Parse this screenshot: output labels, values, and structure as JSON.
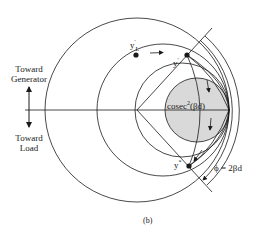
{
  "figure": {
    "caption": "(b)",
    "left_labels": {
      "top": [
        "Toward",
        "Generator"
      ],
      "bottom": [
        "Toward",
        "Load"
      ]
    },
    "points": {
      "yL": {
        "base": "y",
        "sup": "'",
        "sub": "L"
      },
      "y_prime": {
        "base": "y",
        "sup": "'"
      },
      "y_star": {
        "base": "y",
        "sup": "*"
      }
    },
    "shaded_label": {
      "base": "cosec",
      "sup": "2",
      "rest": "(βd)"
    },
    "angle_label": "ϕ = 2βd",
    "colors": {
      "stroke": "#1a1a1a",
      "shade": "#d9d9d9",
      "background": "#ffffff"
    }
  }
}
